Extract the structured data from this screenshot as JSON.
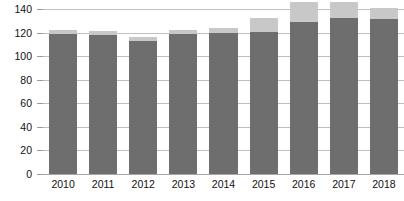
{
  "chart_data": {
    "type": "bar",
    "title": "",
    "subtitle": "",
    "xlabel": "",
    "ylabel": "",
    "categories": [
      "2010",
      "2011",
      "2012",
      "2013",
      "2014",
      "2015",
      "2016",
      "2017",
      "2018"
    ],
    "yticks": [
      0,
      20,
      40,
      60,
      80,
      100,
      120,
      140
    ],
    "ylim": [
      0,
      146
    ],
    "ytick_labels": [
      "0",
      "20",
      "40",
      "60",
      "80",
      "100",
      "120",
      "140"
    ],
    "grid": true,
    "legend": "none",
    "stacked": true,
    "clipped_top": true,
    "note_clipping": "2016 and 2017 light-gray top segments are cut off by the top edge of the image",
    "series": [
      {
        "name": "lower-segment",
        "color": "#6e6e6e",
        "values": [
          119,
          118,
          113,
          119,
          120,
          121,
          129,
          133,
          132
        ]
      },
      {
        "name": "upper-segment",
        "color": "#c8c8c8",
        "values": [
          4,
          4,
          4,
          4,
          4,
          12,
          17,
          13,
          9
        ]
      }
    ],
    "totals": [
      123,
      122,
      117,
      123,
      124,
      133,
      146,
      146,
      141
    ],
    "colors": {
      "bar_dark": "#6e6e6e",
      "bar_light": "#c8c8c8",
      "gridline": "#bfbfbf",
      "axis": "#a8a8a8",
      "text": "#111111",
      "background": "#ffffff"
    }
  }
}
